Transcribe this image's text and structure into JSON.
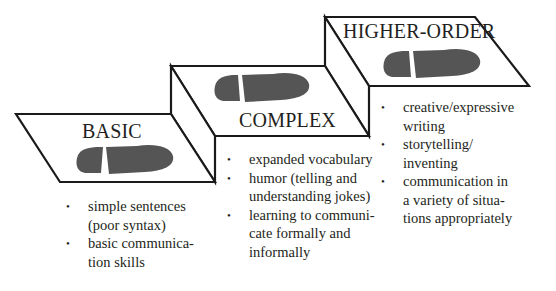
{
  "colors": {
    "line": "#1a1a1a",
    "footprint": "#555555",
    "text": "#231f20",
    "background": "#ffffff"
  },
  "steps": [
    {
      "title": "BASIC",
      "icon": "footprint-icon",
      "points": [
        "simple sentences\n(poor syntax)",
        "basic communica-\ntion skills"
      ]
    },
    {
      "title": "COMPLEX",
      "icon": "footprint-icon",
      "points": [
        "expanded vocabulary",
        "humor (telling and\nunderstanding jokes)",
        "learning to communi-\ncate formally and\ninformally"
      ]
    },
    {
      "title": "HIGHER-ORDER",
      "icon": "footprint-icon",
      "points": [
        "creative/expressive\nwriting",
        "storytelling/\ninventing",
        "communication in\na variety of situa-\ntions appropriately"
      ]
    }
  ]
}
